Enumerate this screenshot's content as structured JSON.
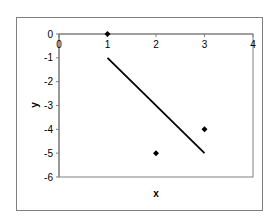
{
  "chart_data": {
    "type": "scatter",
    "title": "",
    "xlabel": "x",
    "ylabel": "y",
    "xlim": [
      0,
      4
    ],
    "ylim": [
      -6,
      0
    ],
    "x_ticks": [
      0,
      1,
      2,
      3,
      4
    ],
    "y_ticks": [
      0,
      -1,
      -2,
      -3,
      -4,
      -5,
      -6
    ],
    "x_tick_labels": [
      "0",
      "1",
      "2",
      "3",
      "4"
    ],
    "y_tick_labels": [
      "0",
      "-1",
      "-2",
      "-3",
      "-4",
      "-5",
      "-6"
    ],
    "grid": false,
    "legend": null,
    "series": [
      {
        "name": "points",
        "type": "scatter",
        "marker": "diamond",
        "x": [
          1,
          2,
          3
        ],
        "y": [
          0,
          -5,
          -4
        ]
      },
      {
        "name": "line",
        "type": "line",
        "x": [
          1,
          3
        ],
        "y": [
          -1,
          -5
        ]
      }
    ],
    "colors": {
      "frame": "#808080",
      "axis": "#808080",
      "marker": "#000000",
      "line": "#000000",
      "text": "#000000"
    }
  }
}
